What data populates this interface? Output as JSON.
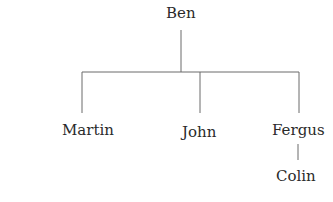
{
  "diagram": {
    "type": "family-tree",
    "root": {
      "label": "Ben",
      "x": 181,
      "y": 5
    },
    "children": [
      {
        "label": "Martin",
        "x": 90,
        "y": 122
      },
      {
        "label": "John",
        "x": 201,
        "y": 124
      },
      {
        "label": "Fergus",
        "x": 299,
        "y": 122,
        "children": [
          {
            "label": "Colin",
            "x": 298,
            "y": 168
          }
        ]
      }
    ],
    "line_color": "#6b6b6b",
    "text_color": "#2a2a2a"
  }
}
